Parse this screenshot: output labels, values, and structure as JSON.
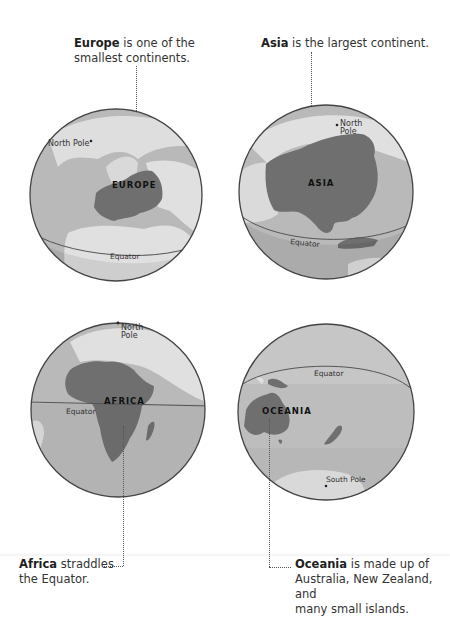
{
  "colors": {
    "ocean": "#b9b9b9",
    "land": "#e0e0e0",
    "highlight": "#6f6f6f",
    "outline": "#444444",
    "text": "#2a2a2a"
  },
  "globes": [
    {
      "id": "europe",
      "continent_label": "EUROPE",
      "caption_bold": "Europe",
      "caption_rest": " is one of the smallest continents.",
      "caption_line1_rest": " is one of the",
      "caption_line2": "smallest continents.",
      "pole_label": "North Pole",
      "equator_label": "Equator"
    },
    {
      "id": "asia",
      "continent_label": "ASIA",
      "caption_bold": "Asia",
      "caption_line1_rest": " is the largest continent.",
      "pole_label_1": "North",
      "pole_label_2": "Pole",
      "equator_label": "Equator"
    },
    {
      "id": "africa",
      "continent_label": "AFRICA",
      "caption_bold": "Africa",
      "caption_line1_rest": " straddles",
      "caption_line2": "the Equator.",
      "pole_label_1": "North",
      "pole_label_2": "Pole",
      "equator_label": "Equator"
    },
    {
      "id": "oceania",
      "continent_label": "OCEANIA",
      "caption_bold": "Oceania",
      "caption_line1_rest": " is made up of",
      "caption_line2": "Australia, New Zealand, and",
      "caption_line3": "many small islands.",
      "pole_label": "South Pole",
      "equator_label": "Equator"
    }
  ]
}
